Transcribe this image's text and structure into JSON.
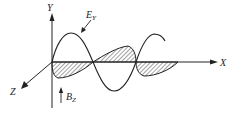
{
  "diagram": {
    "axes": {
      "y_label": "Y",
      "x_label": "X",
      "z_label": "Z"
    },
    "fields": {
      "electric": {
        "label_main": "E",
        "label_sub": "Y"
      },
      "magnetic": {
        "label_main": "B",
        "label_sub": "Z"
      }
    },
    "colors": {
      "ink": "#222222",
      "background": "#ffffff"
    }
  }
}
